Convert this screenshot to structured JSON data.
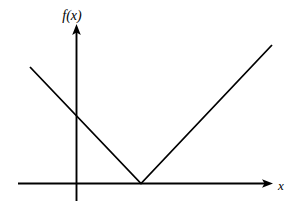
{
  "figure": {
    "title": "",
    "background_color": "#ffffff",
    "stroke_color": "#000000",
    "width": 292,
    "height": 219
  },
  "labels": {
    "y_axis_label": "f(x)",
    "x_axis_label": "x"
  },
  "chart_data": {
    "type": "line",
    "title": "",
    "xlabel": "x",
    "ylabel": "f(x)",
    "grid": false,
    "legend": "none",
    "axes": {
      "x_axis": {
        "drawn_from_px": [
          18,
          183.5
        ],
        "drawn_to_px": [
          273,
          183.5
        ],
        "arrow": "right",
        "ticks": [],
        "tick_labels": []
      },
      "y_axis": {
        "drawn_from_px": [
          76.5,
          201
        ],
        "drawn_to_px": [
          76.5,
          24
        ],
        "arrow": "up",
        "ticks": [],
        "tick_labels": []
      },
      "origin_px": [
        76.5,
        183.5
      ]
    },
    "series": [
      {
        "name": "f(x)",
        "kind": "piecewise-linear",
        "points_px": [
          [
            30,
            67
          ],
          [
            141,
            183.5
          ],
          [
            272,
            45
          ]
        ],
        "vertex_px": [
          141,
          183.5
        ],
        "y_intercept_px": [
          76.5,
          113.5
        ],
        "left_slope_sign": "negative",
        "right_slope_sign": "positive",
        "stroke": "#000000",
        "stroke_width": 1.8
      }
    ]
  }
}
